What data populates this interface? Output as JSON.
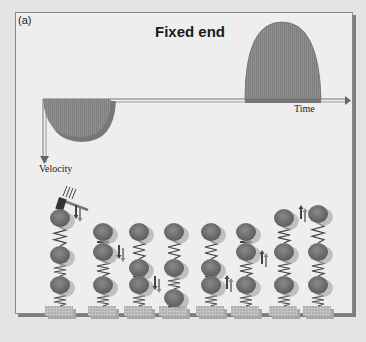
{
  "figure": {
    "panel_label": "(a)",
    "title": "Fixed end",
    "axes": {
      "x_label": "Time",
      "y_label": "Velocity"
    },
    "pulses": [
      {
        "name": "incident-pulse",
        "direction": "down",
        "fill": "#8e8e8e"
      },
      {
        "name": "reflected-pulse",
        "direction": "up",
        "fill": "#8e8e8e"
      }
    ],
    "mass_spring_columns": [
      {
        "index": 1,
        "has_hammer": true,
        "arrow": "down"
      },
      {
        "index": 2,
        "arrow": "down"
      },
      {
        "index": 3,
        "arrow": "down"
      },
      {
        "index": 4,
        "arrow": "none"
      },
      {
        "index": 5,
        "arrow": "up"
      },
      {
        "index": 6,
        "arrow": "up"
      },
      {
        "index": 7,
        "arrow": "up"
      },
      {
        "index": 8,
        "arrow": "none"
      }
    ],
    "colors": {
      "frame_bg": "#eeeeee",
      "pulse_fill": "#8e8e8e",
      "ball_fill": "#707070",
      "ball_shadow": "#a8a8a8",
      "base_fill": "#b8b8b8"
    }
  }
}
